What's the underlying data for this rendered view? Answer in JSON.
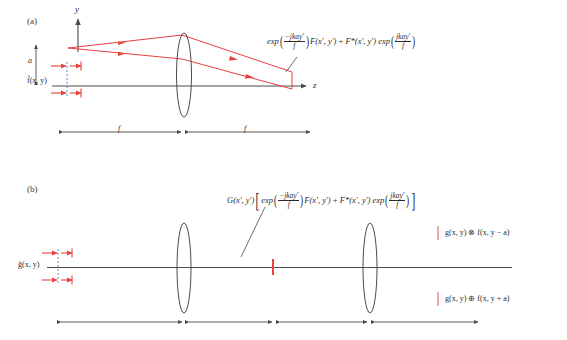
{
  "figure": {
    "type": "optical-system-diagram",
    "panels": [
      {
        "id": "a",
        "label": "(a)",
        "axes": {
          "vertical_label": "y",
          "horizontal_label": "z"
        },
        "input_label": "f̃(x, y)",
        "offset_label": "a",
        "output_equation": {
          "exp_label": "exp",
          "exp1_num": "−jkay′",
          "exp1_den": "f",
          "term1": "F(x′, y′)",
          "plus": "+",
          "term2": "F*(x′, y′)",
          "exp2_label": "exp",
          "exp2_num": "jkay′",
          "exp2_den": "f"
        },
        "distances": [
          {
            "label": "f"
          },
          {
            "label": "f"
          }
        ],
        "lenses": 1
      },
      {
        "id": "b",
        "label": "(b)",
        "input_label": "g̃(x, y)",
        "filter_equation": {
          "prefix": "G(x′, y′)",
          "exp_label": "exp",
          "exp1_num": "−jkay′",
          "exp1_den": "f",
          "term1": "F(x′, y′)",
          "plus": "+",
          "term2": "F*(x′, y′)",
          "exp2_label": "exp",
          "exp2_num": "jkay′",
          "exp2_den": "f"
        },
        "output_upper": "g(x, y) ⊗ f(x, y − a)",
        "output_lower": "g(x, y) ⊕ f(x, y + a)",
        "distances": [
          {
            "label": ""
          },
          {
            "label": ""
          },
          {
            "label": ""
          },
          {
            "label": ""
          }
        ],
        "lenses": 2
      }
    ],
    "colors": {
      "ray": "#e8413f",
      "axis": "#4a4a4a",
      "lens_outline": "#4a4a4a",
      "dashed_guide": "#5b7fc7",
      "text": "#2b2b2b",
      "background": "#ffffff"
    }
  }
}
